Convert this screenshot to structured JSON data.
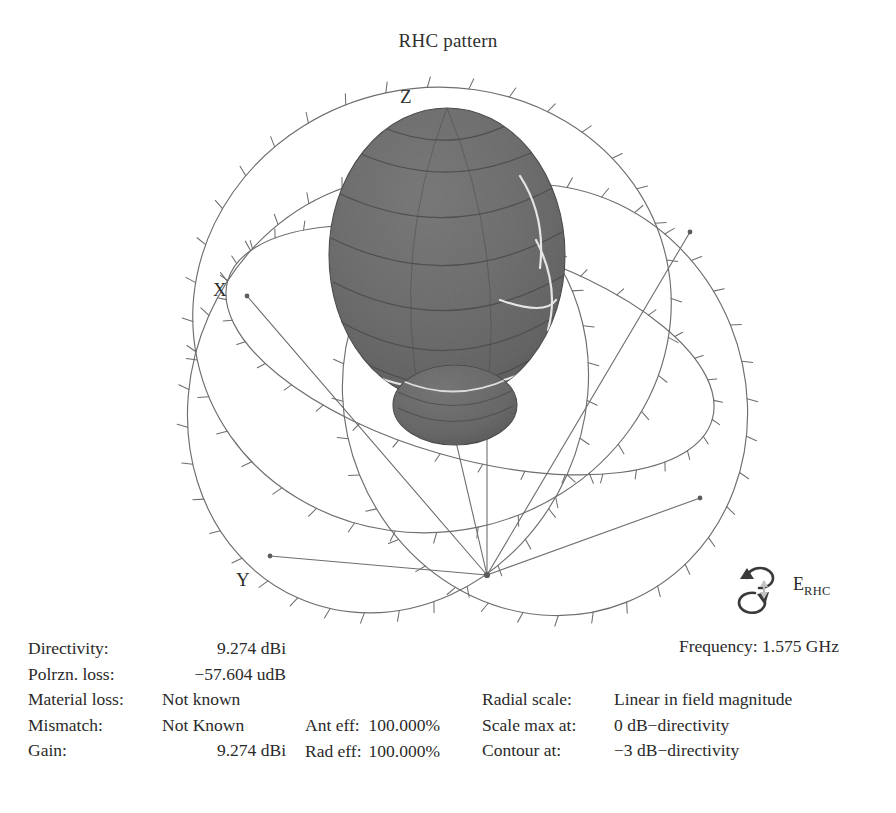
{
  "title": "RHC pattern",
  "axes": {
    "z": "Z",
    "x": "X",
    "y": "Y"
  },
  "polarization": {
    "symbol": "E",
    "subscript": "RHC",
    "icon": "right-hand-circular-polarization-icon"
  },
  "frequency": {
    "label": "Frequency:",
    "value": "1.575 GHz",
    "text": "Frequency: 1.575 GHz"
  },
  "stats": {
    "rows": [
      {
        "label": "Directivity:",
        "value": "9.274 dBi"
      },
      {
        "label": "Polrzn. loss:",
        "value": "−57.604 udB"
      },
      {
        "label": "Material loss:",
        "value": "Not known"
      },
      {
        "label": "Mismatch:",
        "value": "Not Known"
      },
      {
        "label": "Gain:",
        "value": "9.274 dBi"
      }
    ]
  },
  "efficiency": {
    "rows": [
      {
        "label": "Ant eff:",
        "value": "100.000%"
      },
      {
        "label": "Rad eff:",
        "value": "100.000%"
      }
    ]
  },
  "scale": {
    "rows": [
      {
        "label": "Radial scale:",
        "value": "Linear in field magnitude"
      },
      {
        "label": "Scale max at:",
        "value": "0 dB−directivity"
      },
      {
        "label": "Contour at:",
        "value": "−3 dB−directivity"
      }
    ]
  },
  "colors": {
    "background": "#ffffff",
    "text": "#2a2a2a",
    "wireframe": "#6a6a6a",
    "lobe_fill": "#6e6e6e",
    "lobe_dark": "#545454",
    "lobe_light": "#8a8a8a",
    "contour_line": "#e8e8e8"
  },
  "chart_data": {
    "type": "3d-radiation-pattern",
    "title": "RHC pattern",
    "quantity": "RHC (right-hand circular) gain pattern",
    "radial_scale": "Linear in field magnitude",
    "scale_max_at_dB": 0,
    "contour_at_dB": -3,
    "frequency_GHz": 1.575,
    "directivity_dBi": 9.274,
    "gain_dBi": 9.274,
    "polarization_loss_udB": -57.604,
    "antenna_efficiency_pct": 100.0,
    "radiation_efficiency_pct": 100.0,
    "material_loss": "Not known",
    "mismatch": "Not Known",
    "axes": [
      "X",
      "Y",
      "Z"
    ],
    "main_beam_direction": "+Z",
    "graticule_tick_interval_deg": 10,
    "great_circles": 3
  }
}
